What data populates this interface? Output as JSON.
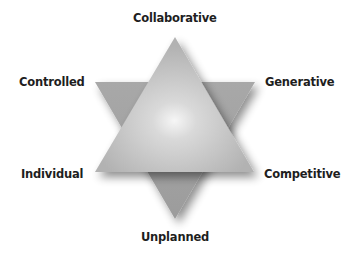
{
  "diagram": {
    "type": "hexagram",
    "labels": {
      "top": "Collaborative",
      "top_left": "Controlled",
      "top_right": "Generative",
      "bottom_left": "Individual",
      "bottom_right": "Competitive",
      "bottom": "Unplanned"
    },
    "colors": {
      "background": "#ffffff",
      "text": "#1e1e1e",
      "triangle_light": "#e6e6e6",
      "triangle_mid": "#b4b4b4",
      "triangle_dark": "#9a9a9a",
      "highlight": "#ffffff"
    }
  }
}
